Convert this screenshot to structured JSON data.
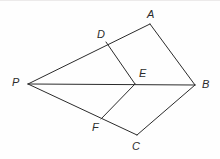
{
  "figure": {
    "background_color": "#fefefe",
    "stroke_color": "#2b2b2b",
    "label_color": "#2b2b2b",
    "canvas": {
      "width": 220,
      "height": 159
    }
  },
  "points": {
    "P": {
      "label": "P",
      "x": 28,
      "y": 84,
      "label_x": 12,
      "label_y": 77
    },
    "A": {
      "label": "A",
      "x": 150,
      "y": 24,
      "label_x": 147,
      "label_y": 9
    },
    "B": {
      "label": "B",
      "x": 195,
      "y": 85,
      "label_x": 202,
      "label_y": 79
    },
    "C": {
      "label": "C",
      "x": 137,
      "y": 135,
      "label_x": 132,
      "label_y": 141
    },
    "D": {
      "label": "D",
      "x": 106,
      "y": 42,
      "label_x": 97,
      "label_y": 29
    },
    "E": {
      "label": "E",
      "x": 135,
      "y": 84,
      "label_x": 139,
      "label_y": 68
    },
    "F": {
      "label": "F",
      "x": 101,
      "y": 119,
      "label_x": 92,
      "label_y": 122
    }
  },
  "edges": [
    {
      "name": "segment-P-A",
      "from": "P",
      "to": "A",
      "path": "M 28 84 L 150 24"
    },
    {
      "name": "segment-A-B",
      "from": "A",
      "to": "B",
      "path": "M 150 24 L 195 85"
    },
    {
      "name": "segment-P-B",
      "from": "P",
      "to": "B",
      "path": "M 28 84 L 195 85"
    },
    {
      "name": "segment-D-E",
      "from": "D",
      "to": "E",
      "path": "M 106 42 L 135 84"
    },
    {
      "name": "segment-F-E",
      "from": "F",
      "to": "E",
      "path": "M 101 119 L 135 84"
    },
    {
      "name": "segment-P-C",
      "from": "P",
      "to": "C",
      "path": "M 28 84 L 137 135"
    },
    {
      "name": "segment-C-B",
      "from": "C",
      "to": "B",
      "path": "M 137 135 L 195 85"
    }
  ]
}
